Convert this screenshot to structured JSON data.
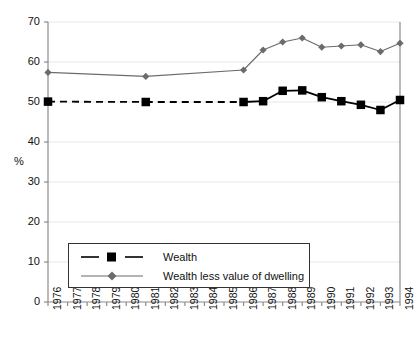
{
  "chart_data": {
    "type": "line",
    "title": "",
    "xlabel": "",
    "ylabel": "%",
    "ylim": [
      0,
      70
    ],
    "ytick_step": 10,
    "yticks": [
      0,
      10,
      20,
      30,
      40,
      50,
      60,
      70
    ],
    "grid": true,
    "grid_axis": "y",
    "legend_position": "inside-lower-left",
    "categories": [
      "1976",
      "1977",
      "1978",
      "1979",
      "1980",
      "1981",
      "1982",
      "1983",
      "1984",
      "1985",
      "1986",
      "1987",
      "1988",
      "1989",
      "1990",
      "1991",
      "1992",
      "1993",
      "1994"
    ],
    "series": [
      {
        "name": "Wealth",
        "color": "#000000",
        "marker": "square",
        "linestyle": "dashed-then-solid",
        "values": [
          50.1,
          null,
          null,
          null,
          null,
          50.0,
          null,
          null,
          null,
          null,
          50.0,
          50.2,
          52.8,
          52.9,
          51.2,
          50.2,
          49.3,
          48.0,
          50.5
        ],
        "marker_years": [
          "1976",
          "1981",
          "1986",
          "1987",
          "1988",
          "1989",
          "1990",
          "1991",
          "1992",
          "1993",
          "1994"
        ]
      },
      {
        "name": "Wealth less value of dwelling",
        "color": "#6b6b6b",
        "marker": "diamond",
        "linestyle": "solid",
        "values": [
          57.4,
          null,
          null,
          null,
          null,
          56.4,
          null,
          null,
          null,
          null,
          58.0,
          63.0,
          65.0,
          66.0,
          63.7,
          64.0,
          64.3,
          62.6,
          64.7
        ],
        "marker_years": [
          "1976",
          "1981",
          "1986",
          "1987",
          "1988",
          "1989",
          "1990",
          "1991",
          "1992",
          "1993",
          "1994"
        ]
      }
    ]
  },
  "legend": {
    "items": [
      {
        "label": "Wealth"
      },
      {
        "label": "Wealth less value of dwelling"
      }
    ]
  },
  "axes": {
    "y_unit_label": "%",
    "y_tick_labels": [
      "70",
      "60",
      "50",
      "40",
      "30",
      "20",
      "10",
      "0"
    ],
    "x_tick_labels": [
      "1976",
      "1977",
      "1978",
      "1979",
      "1980",
      "1981",
      "1982",
      "1983",
      "1984",
      "1985",
      "1986",
      "1987",
      "1988",
      "1989",
      "1990",
      "1991",
      "1992",
      "1993",
      "1994"
    ]
  },
  "colors": {
    "wealth": "#000000",
    "wealth_less_dwelling": "#6b6b6b",
    "grid": "#e8e8e8",
    "axis": "#8c8c8c",
    "text": "#111111"
  }
}
